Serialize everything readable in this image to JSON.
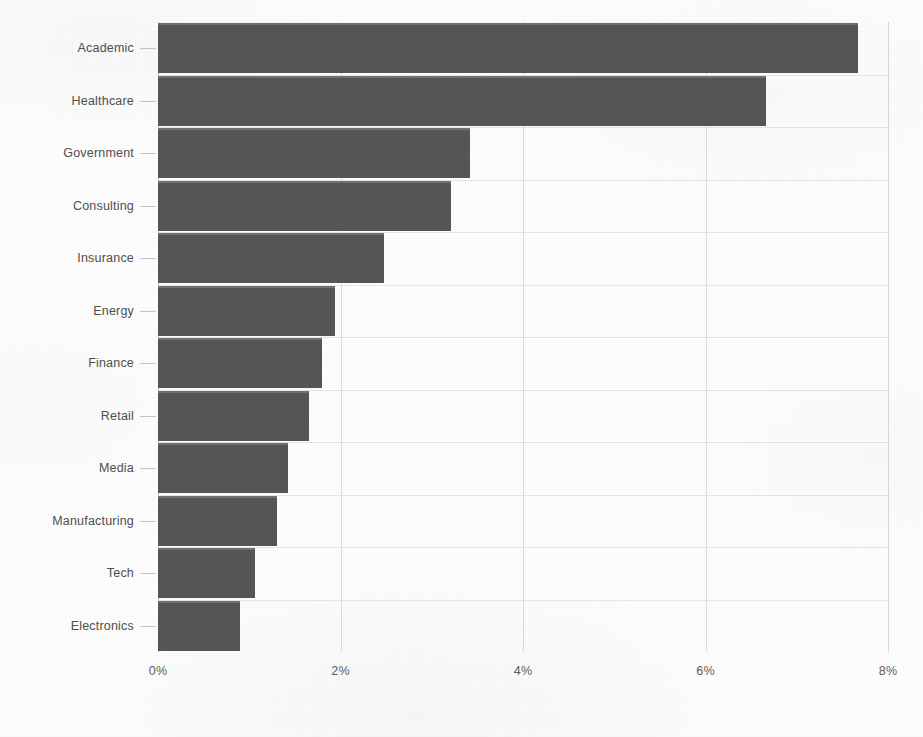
{
  "chart_data": {
    "type": "bar",
    "orientation": "horizontal",
    "title": "",
    "subtitle": "",
    "xlabel": "",
    "ylabel": "",
    "xlim": [
      0,
      8
    ],
    "ylim": null,
    "grid": true,
    "legend": null,
    "legend_position": "none",
    "value_unit": "%",
    "bar_color": "#565656",
    "background_color": "#fdfdfd",
    "gridline_color": "#dcdcdc",
    "text_color": "#4f4f4f",
    "categories": [
      "Academic",
      "Healthcare",
      "Government",
      "Consulting",
      "Insurance",
      "Energy",
      "Finance",
      "Retail",
      "Media",
      "Manufacturing",
      "Tech",
      "Electronics"
    ],
    "values": [
      7.67,
      6.66,
      3.42,
      3.21,
      2.48,
      1.94,
      1.8,
      1.65,
      1.42,
      1.3,
      1.06,
      0.9
    ],
    "xticks": [
      0,
      2,
      4,
      6,
      8
    ],
    "xticklabels": [
      "0%",
      "2%",
      "4%",
      "6%",
      "8%"
    ]
  }
}
